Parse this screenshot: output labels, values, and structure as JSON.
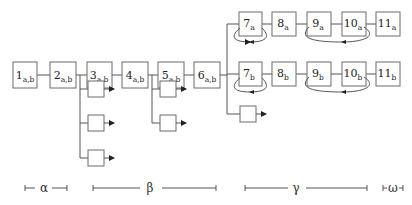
{
  "diagram": {
    "main_chain": [
      {
        "num": "1",
        "sub": "a,b"
      },
      {
        "num": "2",
        "sub": "a,b"
      },
      {
        "num": "3",
        "sub": "a,b"
      },
      {
        "num": "4",
        "sub": "a,b"
      },
      {
        "num": "5",
        "sub": "a,b"
      },
      {
        "num": "6",
        "sub": "a,b"
      }
    ],
    "branch_a": [
      {
        "num": "7",
        "sub": "a"
      },
      {
        "num": "8",
        "sub": "a"
      },
      {
        "num": "9",
        "sub": "a"
      },
      {
        "num": "10",
        "sub": "a"
      },
      {
        "num": "11",
        "sub": "a"
      }
    ],
    "branch_b": [
      {
        "num": "7",
        "sub": "b"
      },
      {
        "num": "8",
        "sub": "b"
      },
      {
        "num": "9",
        "sub": "b"
      },
      {
        "num": "10",
        "sub": "b"
      },
      {
        "num": "11",
        "sub": "b"
      }
    ],
    "side_outputs": {
      "after_3": 3,
      "after_5": 2,
      "after_6": 1
    },
    "loops": [
      {
        "branch": "a",
        "from": "7",
        "to": "7"
      },
      {
        "branch": "a",
        "from": "10",
        "to": "9"
      },
      {
        "branch": "b",
        "from": "7",
        "to": "7"
      },
      {
        "branch": "b",
        "from": "10",
        "to": "9"
      }
    ],
    "phases": [
      {
        "label": "α"
      },
      {
        "label": "β"
      },
      {
        "label": "γ"
      },
      {
        "label": "ω"
      }
    ]
  }
}
